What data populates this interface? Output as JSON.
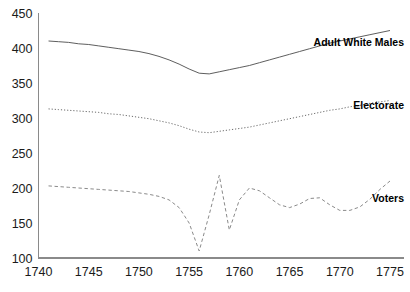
{
  "chart_data": {
    "type": "line",
    "title": "",
    "xlabel": "",
    "ylabel": "",
    "xlim": [
      1740,
      1775
    ],
    "ylim": [
      100,
      450
    ],
    "grid": false,
    "legend_position": "inline-right-of-line-ends",
    "x_ticks": [
      "1740",
      "1745",
      "1750",
      "1755",
      "1760",
      "1765",
      "1770",
      "1775"
    ],
    "y_ticks": [
      "100",
      "150",
      "200",
      "250",
      "300",
      "350",
      "400",
      "450"
    ],
    "x_tick_values": [
      1740,
      1745,
      1750,
      1755,
      1760,
      1765,
      1770,
      1775
    ],
    "y_tick_values": [
      100,
      150,
      200,
      250,
      300,
      350,
      400,
      450
    ],
    "x": [
      1741,
      1742,
      1743,
      1744,
      1745,
      1746,
      1747,
      1748,
      1749,
      1750,
      1751,
      1752,
      1753,
      1754,
      1755,
      1756,
      1757,
      1758,
      1759,
      1760,
      1761,
      1762,
      1763,
      1764,
      1765,
      1766,
      1767,
      1768,
      1769,
      1770,
      1771,
      1772,
      1773,
      1774,
      1775
    ],
    "series": [
      {
        "name": "Adult White Males",
        "style": "solid",
        "color": "#555555",
        "label_x": 1775,
        "label_y": 408,
        "values": [
          410,
          409,
          408,
          406,
          405,
          403,
          401,
          399,
          397,
          395,
          392,
          388,
          383,
          377,
          370,
          364,
          363,
          366,
          369,
          372,
          375,
          379,
          383,
          387,
          391,
          395,
          399,
          403,
          407,
          410,
          413,
          416,
          419,
          422,
          425
        ]
      },
      {
        "name": "Electorate",
        "style": "dotted",
        "color": "#6b6b6b",
        "label_x": 1775,
        "label_y": 318,
        "values": [
          313,
          312,
          311,
          310,
          309,
          308,
          306,
          305,
          303,
          301,
          299,
          296,
          293,
          289,
          284,
          280,
          279,
          281,
          283,
          285,
          287,
          290,
          293,
          296,
          299,
          302,
          305,
          308,
          311,
          313,
          316,
          318,
          321,
          323,
          325
        ]
      },
      {
        "name": "Voters",
        "style": "dashed",
        "color": "#8a8a8a",
        "label_x": 1775,
        "label_y": 186,
        "values": [
          203,
          202,
          201,
          200,
          199,
          198,
          197,
          196,
          195,
          193,
          191,
          188,
          183,
          172,
          150,
          110,
          162,
          218,
          140,
          183,
          200,
          196,
          186,
          176,
          172,
          177,
          185,
          186,
          176,
          168,
          168,
          173,
          184,
          198,
          210
        ]
      }
    ]
  }
}
